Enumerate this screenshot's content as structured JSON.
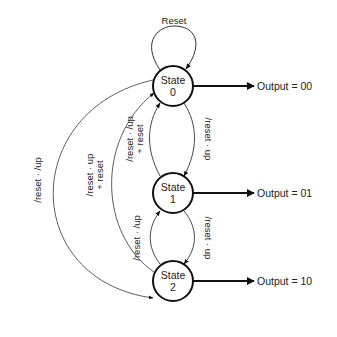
{
  "diagram": {
    "type": "state-machine",
    "states": [
      {
        "id": "s0",
        "line1": "State",
        "line2": "0",
        "output": "Output = 00"
      },
      {
        "id": "s1",
        "line1": "State",
        "line2": "1",
        "output": "Output = 01"
      },
      {
        "id": "s2",
        "line1": "State",
        "line2": "2",
        "output": "Output = 10"
      }
    ],
    "transitions": [
      {
        "from": "s0",
        "to": "s0",
        "label": "Reset"
      },
      {
        "from": "s0",
        "to": "s1",
        "label": "/reset · up"
      },
      {
        "from": "s1",
        "to": "s0",
        "label1": "/reset · /up",
        "label2": "+ reset"
      },
      {
        "from": "s1",
        "to": "s2",
        "label": "/reset · up"
      },
      {
        "from": "s2",
        "to": "s1",
        "label": "/reset · /up"
      },
      {
        "from": "s2",
        "to": "s0",
        "label1": "/reset · up",
        "label2": "+ reset"
      },
      {
        "from": "s0",
        "to": "s2",
        "label": "/reset · /up"
      }
    ]
  }
}
